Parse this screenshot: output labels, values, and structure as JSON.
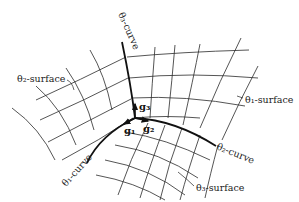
{
  "figure": {
    "type": "curvilinear-coordinate-diagram",
    "labels": {
      "theta3_curve": "θ₃-curve",
      "theta2_surface": "θ₂-surface",
      "theta1_surface": "θ₁-surface",
      "theta2_curve": "θ₂-curve",
      "theta1_curve": "θ₁-curve",
      "theta3_surface": "θ₃-surface"
    },
    "vectors": {
      "g1": "g₁",
      "g2": "g₂",
      "g3": "g₃"
    },
    "origin": [
      135,
      118
    ]
  }
}
